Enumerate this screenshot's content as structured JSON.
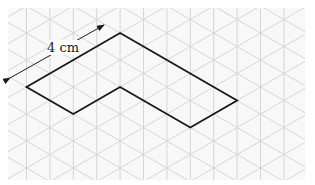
{
  "diagram": {
    "type": "isometric-grid-shape",
    "label": "4 cm",
    "grid": {
      "clip": {
        "x": 8,
        "y": 8,
        "width": 297,
        "height": 172
      },
      "column_spacing": 23.4,
      "first_column_x": 26.5,
      "row_spacing": 27.0,
      "origin_y": 87,
      "line_color": "#d6d6d6",
      "background": "#f8f8f8"
    },
    "shape": {
      "stroke": "#1a1a1a",
      "stroke_width": 1.8,
      "vertices": [
        [
          26.5,
          87
        ],
        [
          120.1,
          33
        ],
        [
          237.1,
          100.5
        ],
        [
          190.3,
          127.5
        ],
        [
          120.1,
          87
        ],
        [
          73.3,
          114
        ]
      ]
    },
    "dimension_arrow": {
      "from": [
        10,
        78
      ],
      "to": [
        104,
        25
      ],
      "color": "#1a1a1a",
      "label_pos": [
        63,
        52
      ]
    }
  }
}
